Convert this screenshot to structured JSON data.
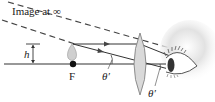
{
  "diagram": {
    "title_label": "Image at ∞",
    "height_label": "h",
    "focal_label": "F",
    "angle_label_1": "θ′",
    "angle_label_2": "θ′",
    "elements": {
      "optical_axis": "horizontal line through F and lens center",
      "object": "small candle flame at F of height h",
      "lens": "converging (biconvex) magnifying lens",
      "eye": "observer eye right of lens",
      "rays": [
        "ray parallel to axis through lens top",
        "ray through lens center at angle θ′"
      ],
      "virtual_rays": [
        "dashed extensions back toward image at infinity"
      ]
    },
    "colors": {
      "line": "#333333",
      "lens_fill": "#d8d8d8",
      "focal_point": "#111111",
      "eye_shade": "#cfcfcf"
    }
  }
}
